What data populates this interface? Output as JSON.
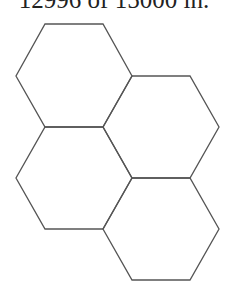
{
  "caption": "12996 of 15000 in.",
  "diagram": {
    "type": "hexagon-tiling",
    "stroke_color": "#555555",
    "background": "#ffffff",
    "hexagons": [
      {
        "id": "hex-top-left",
        "points": "45,24 103,24 132,76 103,127 45,127 16,76"
      },
      {
        "id": "hex-middle-right",
        "points": "132,76 190,76 219,127 190,178 132,178 103,127"
      },
      {
        "id": "hex-middle-left",
        "points": "45,127 103,127 132,178 103,229 45,229 16,178"
      },
      {
        "id": "hex-bottom-right",
        "points": "132,178 190,178 219,229 190,280 132,280 103,229"
      }
    ]
  }
}
